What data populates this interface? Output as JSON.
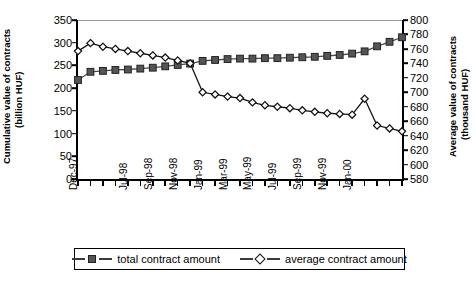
{
  "chart_data": {
    "type": "line",
    "title": "",
    "xlabel": "",
    "categories": [
      "Dec-97",
      "Jan-98",
      "Feb-98",
      "Mar-98",
      "Apr-98",
      "May-98",
      "Jun-98",
      "Jul-98",
      "Aug-98",
      "Sep-98",
      "Oct-98",
      "Nov-98",
      "Dec-98",
      "Jan-99",
      "Feb-99",
      "Mar-99",
      "Apr-99",
      "May-99",
      "Jun-99",
      "Jul-99",
      "Aug-99",
      "Sep-99",
      "Oct-99",
      "Nov-99",
      "Dec-99",
      "Jan-00",
      "Feb-00"
    ],
    "x_tick_labels": [
      "Dec-97",
      "Jul-98",
      "Sep-98",
      "Nov-98",
      "Jan-99",
      "Mar-99",
      "May-99",
      "Jul-99",
      "Sep-99",
      "Nov-99",
      "Jan-00"
    ],
    "x_tick_label_indices": [
      0,
      4,
      6,
      8,
      10,
      12,
      14,
      16,
      18,
      20,
      22
    ],
    "grid": false,
    "legend_position": "bottom",
    "axes": [
      {
        "id": "left",
        "ylabel": "Cumulative value of contracts (billion HUF)",
        "ylabel_line1": "Cumulative value of contracts",
        "ylabel_line2": "(billion HUF)",
        "ylim": [
          0,
          350
        ],
        "ytick_step": 50,
        "yticks": [
          0,
          50,
          100,
          150,
          200,
          250,
          300,
          350
        ]
      },
      {
        "id": "right",
        "ylabel": "Average value of contracts (thousand HUF)",
        "ylabel_line1": "Average value of contracts",
        "ylabel_line2": "(thousand HUF)",
        "ylim": [
          580,
          800
        ],
        "ytick_step": 20,
        "yticks": [
          580,
          600,
          620,
          640,
          660,
          680,
          700,
          720,
          740,
          760,
          780,
          800
        ]
      }
    ],
    "series": [
      {
        "name": "total contract amount",
        "axis": "left",
        "marker": "filled-square",
        "color": "#555555",
        "values": [
          218,
          236,
          238,
          240,
          241,
          243,
          245,
          248,
          251,
          254,
          260,
          262,
          264,
          265,
          265,
          266,
          266,
          267,
          268,
          269,
          271,
          273,
          276,
          281,
          292,
          302,
          312
        ]
      },
      {
        "name": "average contract amount",
        "axis": "right",
        "marker": "open-diamond",
        "color": "#111111",
        "values": [
          757,
          768,
          763,
          760,
          757,
          754,
          751,
          748,
          744,
          740,
          700,
          697,
          694,
          692,
          686,
          682,
          680,
          678,
          675,
          673,
          671,
          670,
          669,
          691,
          654,
          650,
          646
        ]
      }
    ]
  },
  "legend": {
    "items": [
      {
        "label": "total contract amount",
        "marker": "filled-square"
      },
      {
        "label": "average contract amount",
        "marker": "open-diamond"
      }
    ]
  }
}
